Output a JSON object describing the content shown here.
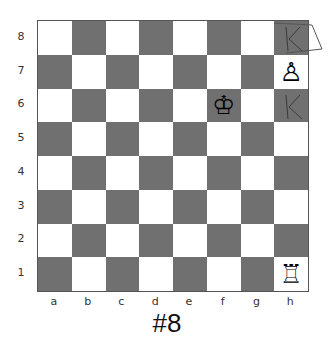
{
  "puzzle": {
    "label": "#8"
  },
  "board": {
    "ranks": [
      "8",
      "7",
      "6",
      "5",
      "4",
      "3",
      "2",
      "1"
    ],
    "files": [
      "a",
      "b",
      "c",
      "d",
      "e",
      "f",
      "g",
      "h"
    ],
    "colors": {
      "light": "#ffffff",
      "dark": "#707070"
    },
    "pieces": [
      {
        "square": "f6",
        "piece": "white-king",
        "glyph": "♔"
      },
      {
        "square": "h7",
        "piece": "white-pawn",
        "glyph": "♙"
      },
      {
        "square": "h1",
        "piece": "white-rook",
        "glyph": "♖"
      }
    ],
    "annotations": [
      {
        "square": "h8",
        "mark": "K",
        "note": "hand-drawn K with box"
      },
      {
        "square": "h6",
        "mark": "K",
        "note": "hand-drawn K"
      }
    ]
  }
}
